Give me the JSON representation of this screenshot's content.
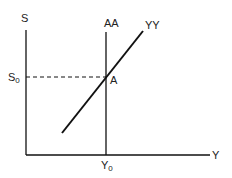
{
  "diagram": {
    "type": "economics-equilibrium",
    "axes": {
      "y_label": "S",
      "x_label": "Y"
    },
    "curves": [
      {
        "name": "AA",
        "label": "AA",
        "shape": "vertical"
      },
      {
        "name": "YY",
        "label": "YY",
        "shape": "upward-sloping"
      }
    ],
    "equilibrium": {
      "point_label": "A",
      "s_level": {
        "base": "S",
        "sub": "0"
      },
      "y_level": {
        "base": "Y",
        "sub": "0"
      }
    },
    "colors": {
      "line": "#111111",
      "background": "#ffffff"
    }
  }
}
